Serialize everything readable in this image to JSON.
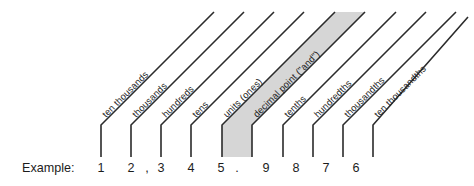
{
  "diagram": {
    "title_row_label": "Example:",
    "example_number": "12,345.9876",
    "colors": {
      "background": "#ffffff",
      "line": "#2b2b2b",
      "highlight_band": "#d6d6d6",
      "text": "#1c1c1c"
    },
    "highlight": {
      "column": "decimal point (\"and\")",
      "note": "shaded band marks the decimal point column"
    },
    "columns": [
      {
        "place_label": "ten thousands",
        "digit": "1",
        "stem_x": 101,
        "label_x": 107,
        "label_y": 118,
        "digit_x": 101,
        "highlighted": false,
        "separator_before": null
      },
      {
        "place_label": "thousands",
        "digit": "2",
        "stem_x": 131,
        "label_x": 137,
        "label_y": 118,
        "digit_x": 131,
        "highlighted": false,
        "separator_before": null
      },
      {
        "place_label": "hundreds",
        "digit": "3",
        "stem_x": 161,
        "label_x": 167,
        "label_y": 118,
        "digit_x": 161,
        "highlighted": false,
        "separator_before": ","
      },
      {
        "place_label": "tens",
        "digit": "4",
        "stem_x": 191,
        "label_x": 197,
        "label_y": 118,
        "digit_x": 191,
        "highlighted": false,
        "separator_before": null
      },
      {
        "place_label": "units (ones)",
        "digit": "5",
        "stem_x": 222,
        "label_x": 228,
        "label_y": 118,
        "digit_x": 221,
        "highlighted": false,
        "separator_before": null
      },
      {
        "place_label": "decimal point (\"and\")",
        "digit": ".",
        "stem_x": 252,
        "label_x": 258,
        "label_y": 118,
        "digit_x": 237,
        "highlighted": true,
        "separator_before": null
      },
      {
        "place_label": "tenths",
        "digit": "9",
        "stem_x": 283,
        "label_x": 289,
        "label_y": 118,
        "digit_x": 266,
        "highlighted": false,
        "separator_before": null
      },
      {
        "place_label": "hundredths",
        "digit": "8",
        "stem_x": 313,
        "label_x": 319,
        "label_y": 118,
        "digit_x": 296,
        "highlighted": false,
        "separator_before": null
      },
      {
        "place_label": "thousandths",
        "digit": "7",
        "stem_x": 343,
        "label_x": 349,
        "label_y": 118,
        "digit_x": 326,
        "highlighted": false,
        "separator_before": null
      },
      {
        "place_label": "ten thousandths",
        "digit": "6",
        "stem_x": 373,
        "label_x": 379,
        "label_y": 118,
        "digit_x": 356,
        "highlighted": false,
        "separator_before": null
      }
    ],
    "geometry": {
      "stem_bottom_y": 157,
      "stem_top_y": 125,
      "diagonal_top_y": 12,
      "digit_baseline_y": 172,
      "example_label_x": 22,
      "example_label_y": 172
    }
  }
}
